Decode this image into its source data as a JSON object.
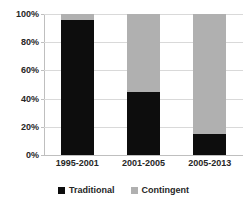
{
  "chart_data": {
    "type": "bar",
    "stacked": true,
    "stack_mode": "percent",
    "title": "",
    "subtitle": "",
    "xlabel": "",
    "ylabel": "",
    "categories": [
      "1995-2001",
      "2001-2005",
      "2005-2013"
    ],
    "series": [
      {
        "name": "Traditional",
        "color": "#0d0d0d",
        "values": [
          96,
          45,
          15
        ]
      },
      {
        "name": "Contingent",
        "color": "#b0b0b0",
        "values": [
          4,
          55,
          85
        ]
      }
    ],
    "ylim": [
      0,
      100
    ],
    "y_ticks": [
      0,
      20,
      40,
      60,
      80,
      100
    ],
    "y_tick_labels": [
      "0%",
      "20%",
      "40%",
      "60%",
      "80%",
      "100%"
    ],
    "grid": true,
    "grid_axis": "y",
    "legend_position": "bottom",
    "legend_entries": [
      "Traditional",
      "Contingent"
    ],
    "annotations": []
  },
  "axis": {
    "y_tick_labels": [
      "100%",
      "80%",
      "60%",
      "40%",
      "20%",
      "0%"
    ]
  },
  "legend": {
    "items": [
      {
        "label": "Traditional",
        "color": "#0d0d0d"
      },
      {
        "label": "Contingent",
        "color": "#b0b0b0"
      }
    ]
  },
  "colors": {
    "traditional": "#0d0d0d",
    "contingent": "#b0b0b0",
    "gridline": "#d9d9d9",
    "axis": "#bfbfbf",
    "text": "#262626",
    "background": "#ffffff"
  }
}
